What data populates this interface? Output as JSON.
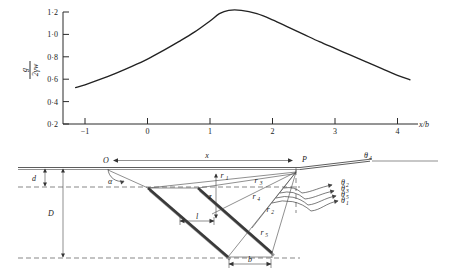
{
  "figure": {
    "title": "",
    "panels": [
      "pressure-distribution-plot",
      "failure-wedge-diagram"
    ]
  },
  "chart_data": {
    "type": "line",
    "title": "",
    "xlabel": "x/b",
    "ylabel": "g / 2γw",
    "ylabel_numerator": "g",
    "ylabel_denominator": "2γw",
    "xlim": [
      -1.35,
      4.4
    ],
    "ylim": [
      0.2,
      1.28
    ],
    "xticks": [
      -1,
      0,
      1,
      2,
      3,
      4
    ],
    "xtick_labels": [
      "−1",
      "0",
      "1",
      "2",
      "3",
      "4"
    ],
    "yticks": [
      0.2,
      0.4,
      0.6,
      0.8,
      1.0,
      1.2
    ],
    "ytick_labels": [
      "0·2",
      "0·4",
      "0·6",
      "0·8",
      "1·0",
      "1·2"
    ],
    "grid": false,
    "legend": "none",
    "series": [
      {
        "name": "g/2γw",
        "x": [
          -1.15,
          -1.0,
          -0.75,
          -0.5,
          -0.25,
          0.0,
          0.25,
          0.5,
          0.75,
          1.0,
          1.15,
          1.3,
          1.5,
          1.75,
          2.0,
          2.25,
          2.5,
          2.75,
          3.0,
          3.25,
          3.5,
          3.75,
          4.0,
          4.2
        ],
        "y": [
          0.525,
          0.55,
          0.6,
          0.655,
          0.715,
          0.78,
          0.855,
          0.935,
          1.02,
          1.12,
          1.185,
          1.215,
          1.215,
          1.185,
          1.13,
          1.065,
          1.0,
          0.935,
          0.875,
          0.815,
          0.755,
          0.695,
          0.635,
          0.595
        ]
      }
    ]
  },
  "diagram": {
    "name": "failure-wedge-geometry",
    "labels": {
      "point_O": "O",
      "point_P": "P",
      "span_x": "x",
      "depth_d": "d",
      "depth_D": "D",
      "angle_alpha": "α",
      "length_l": "l",
      "width_b": "b",
      "depth_z": "z",
      "radius_r1": "r",
      "radius_r1_sub": "1",
      "radius_r2": "r",
      "radius_r2_sub": "2",
      "radius_r3": "r",
      "radius_r3_sub": "3",
      "radius_r4": "r",
      "radius_r4_sub": "4",
      "radius_r5": "r",
      "radius_r5_sub": "5",
      "theta1": "θ",
      "theta1_sub": "1",
      "theta2": "θ",
      "theta2_sub": "2",
      "theta3": "θ",
      "theta3_sub": "3",
      "theta4": "θ",
      "theta4_sub": "4",
      "theta5": "θ",
      "theta5_sub": "5"
    }
  }
}
